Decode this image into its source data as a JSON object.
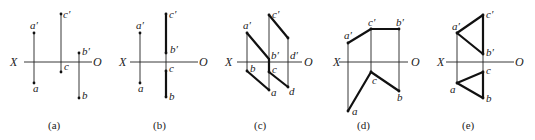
{
  "figure": {
    "axis": {
      "left_label": "X",
      "right_label": "O"
    },
    "panels": [
      {
        "id": "a",
        "caption": "(a)",
        "points": {
          "a_prime": "a′",
          "a": "a",
          "c_prime": "c′",
          "c": "c",
          "b_prime": "b′",
          "b": "b"
        }
      },
      {
        "id": "b",
        "caption": "(b)",
        "points": {
          "a_prime": "a′",
          "a": "a",
          "c_prime": "c′",
          "b_prime": "b′",
          "c": "c",
          "b": "b"
        }
      },
      {
        "id": "c",
        "caption": "(c)",
        "points": {
          "a_prime": "a′",
          "c_prime": "c′",
          "b_prime": "b′",
          "d_prime": "d′",
          "b": "b",
          "c": "c",
          "a": "a",
          "d": "d"
        }
      },
      {
        "id": "d",
        "caption": "(d)",
        "points": {
          "a_prime": "a′",
          "c_prime": "c′",
          "b_prime": "b′",
          "c": "c",
          "b": "b",
          "a": "a"
        }
      },
      {
        "id": "e",
        "caption": "(e)",
        "points": {
          "a_prime": "a′",
          "c_prime": "c′",
          "b_prime": "b′",
          "c": "c",
          "a": "a",
          "b": "b"
        }
      }
    ]
  }
}
